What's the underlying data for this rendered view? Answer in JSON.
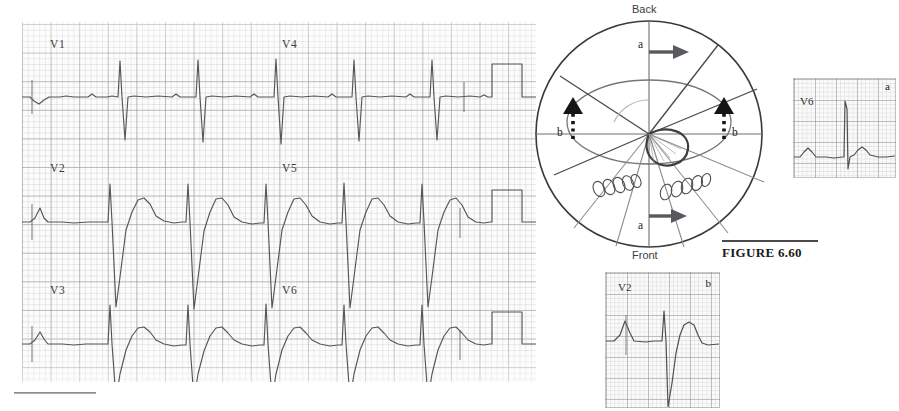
{
  "figure": {
    "caption": "FIGURE 6.60",
    "caption_rule": true
  },
  "ecg_panel": {
    "name": "12-lead precordial ECG recording",
    "grid": {
      "small_box_color": "#b6b6b9",
      "large_box_color": "#969698",
      "paper_color": "#fdfcfc"
    },
    "trace_color": "#55555a",
    "rows": [
      {
        "left_lead": "V1",
        "right_lead": "V4"
      },
      {
        "left_lead": "V2",
        "right_lead": "V5"
      },
      {
        "left_lead": "V3",
        "right_lead": "V6"
      }
    ],
    "leads": [
      "V1",
      "V2",
      "V3",
      "V4",
      "V5",
      "V6"
    ],
    "calibration_pulse": true
  },
  "diagram": {
    "name": "horizontal-plane vector loop diagram",
    "orientation_labels": {
      "top": "Back",
      "bottom": "Front"
    },
    "vector_labels": [
      {
        "id": "a-top",
        "text": "a",
        "arrow": "solid-right"
      },
      {
        "id": "b-left",
        "text": "b",
        "arrow": "dotted-up"
      },
      {
        "id": "b-right",
        "text": "b",
        "arrow": "dotted-up"
      },
      {
        "id": "a-bottom",
        "text": "a",
        "arrow": "solid-right"
      }
    ],
    "outer_circle_color": "#3a3a3a",
    "ellipse_color": "#6f6f72",
    "loop_color": "#4a4a4a",
    "bead_chains": 2
  },
  "insets": [
    {
      "id": "v6",
      "lead": "V6",
      "mark": "a",
      "morphology": "tall R wave"
    },
    {
      "id": "v2",
      "lead": "V2",
      "mark": "b",
      "morphology": "deep S wave with tall T wave"
    }
  ]
}
